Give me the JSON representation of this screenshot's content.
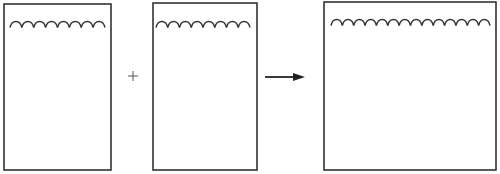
{
  "diagram": {
    "operator": "+",
    "arrow": "right",
    "containers": [
      {
        "id": "container-a",
        "x": 4,
        "y": 4,
        "w": 107,
        "h": 166,
        "wave": {
          "x1": 10,
          "x2": 105,
          "y": 24,
          "humps": 8
        }
      },
      {
        "id": "container-b",
        "x": 153,
        "y": 3,
        "w": 104,
        "h": 167,
        "wave": {
          "x1": 156,
          "x2": 250,
          "y": 24,
          "humps": 8
        }
      },
      {
        "id": "container-result",
        "x": 324,
        "y": 2,
        "w": 172,
        "h": 168,
        "wave": {
          "x1": 331,
          "x2": 490,
          "y": 22,
          "humps": 14
        }
      }
    ],
    "plus": {
      "x": 133,
      "y": 76,
      "size": 10
    },
    "arrow_geom": {
      "x1": 265,
      "x2": 305,
      "y": 77
    },
    "stroke_color": "#333333"
  }
}
